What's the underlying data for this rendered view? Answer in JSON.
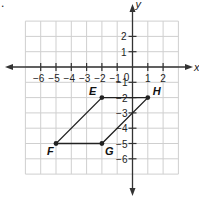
{
  "problem_marker": ".",
  "axes": {
    "x_label": "x",
    "y_label": "y",
    "x_ticks": [
      "-6",
      "-5",
      "-4",
      "-3",
      "-2",
      "-1",
      "1",
      "2"
    ],
    "y_ticks_positive": [
      "2",
      "1"
    ],
    "y_ticks_negative": [
      "-1",
      "-2",
      "-3",
      "-4",
      "-5",
      "-6"
    ],
    "origin": "0"
  },
  "points": [
    {
      "label": "E",
      "x": -2,
      "y": -2
    },
    {
      "label": "H",
      "x": 1,
      "y": -2
    },
    {
      "label": "F",
      "x": -5,
      "y": -5
    },
    {
      "label": "G",
      "x": -2,
      "y": -5
    }
  ],
  "shape": "parallelogram EHGF",
  "colors": {
    "grid": "#cfcfcf",
    "axis": "#333333",
    "shape": "#222222"
  }
}
